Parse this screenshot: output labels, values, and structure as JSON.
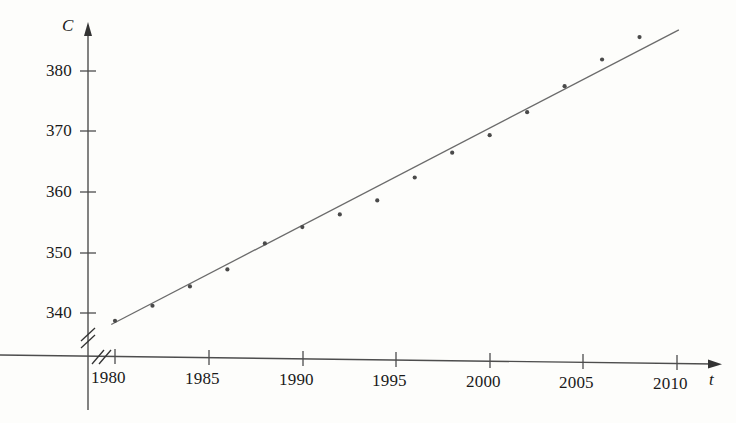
{
  "chart_data": {
    "type": "scatter",
    "title": "",
    "subtitle": "",
    "xlabel": "t",
    "ylabel": "C",
    "xlim": [
      1978.2,
      2011.5
    ],
    "ylim": [
      336.8,
      387.5
    ],
    "grid": false,
    "legend": false,
    "legend_position": "none",
    "axis_break_x": true,
    "axis_break_y": true,
    "xticks": [
      1980,
      1985,
      1990,
      1995,
      2000,
      2005,
      2010
    ],
    "xtick_labels": [
      "1980",
      "1985",
      "1990",
      "1995",
      "2000",
      "2005",
      "2010"
    ],
    "yticks": [
      340,
      350,
      360,
      370,
      380
    ],
    "ytick_labels": [
      "340",
      "350",
      "360",
      "370",
      "380"
    ],
    "x": [
      1980,
      1982,
      1984,
      1986,
      1988,
      1990,
      1992,
      1994,
      1996,
      1998,
      2000,
      2002,
      2004,
      2006,
      2008
    ],
    "y": [
      338.7,
      341.2,
      344.4,
      347.2,
      351.5,
      354.2,
      356.3,
      358.6,
      362.4,
      366.5,
      369.4,
      373.2,
      377.5,
      381.9,
      385.6
    ],
    "series": [
      {
        "name": "CO2 observations",
        "marker": "dot",
        "color": "#4a4a4a",
        "values": [
          338.7,
          341.2,
          344.4,
          347.2,
          351.5,
          354.2,
          356.3,
          358.6,
          362.4,
          366.5,
          369.4,
          373.2,
          377.5,
          381.9,
          385.6
        ]
      }
    ],
    "trendline": {
      "name": "regression line",
      "color": "#6b6b6b",
      "x_start": 1979.8,
      "y_start": 338.1,
      "x_end": 2010.1,
      "y_end": 386.8
    },
    "annotations": []
  },
  "axes": {
    "y_axis_name": "C",
    "x_axis_name": "t"
  }
}
